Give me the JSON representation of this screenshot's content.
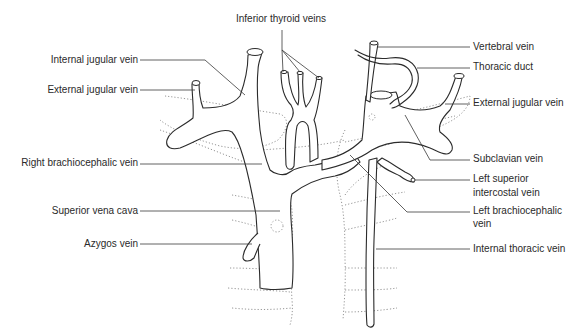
{
  "figure": {
    "labels": {
      "inferior_thyroid_veins": "Inferior thyroid veins",
      "internal_jugular_vein": "Internal jugular vein",
      "external_jugular_vein_right": "External jugular vein",
      "right_brachiocephalic_vein": "Right brachiocephalic vein",
      "superior_vena_cava": "Superior vena cava",
      "azygos_vein": "Azygos vein",
      "vertebral_vein": "Vertebral vein",
      "thoracic_duct": "Thoracic duct",
      "external_jugular_vein_left": "External jugular vein",
      "subclavian_vein": "Subclavian vein",
      "left_superior_intercostal_vein_line1": "Left superior",
      "left_superior_intercostal_vein_line2": "intercostal vein",
      "left_brachiocephalic_vein_line1": "Left brachiocephalic",
      "left_brachiocephalic_vein_line2": "vein",
      "internal_thoracic_vein": "Internal thoracic vein"
    }
  },
  "colors": {
    "line": "#2b2b2b",
    "dotted_outline": "#8a8a8a",
    "text": "#2a2a2a",
    "background": "#ffffff"
  }
}
